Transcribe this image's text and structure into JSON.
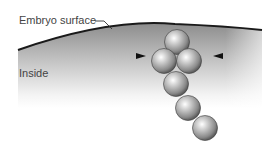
{
  "labels": {
    "surface": "Embryo surface",
    "inside": "Inside"
  },
  "colors": {
    "surface_line": "#1a1a1a",
    "shading_dark": "#8a8a8a",
    "sphere_mid": "#9a9a9a",
    "label_text": "#444444"
  },
  "spheres": [
    {
      "cx": 177,
      "cy": 42
    },
    {
      "cx": 164,
      "cy": 61
    },
    {
      "cx": 189,
      "cy": 61
    },
    {
      "cx": 176,
      "cy": 84
    },
    {
      "cx": 188,
      "cy": 108
    },
    {
      "cx": 205,
      "cy": 128
    }
  ],
  "arrowheads": [
    {
      "direction": "right",
      "x": 143,
      "y": 56
    },
    {
      "direction": "left",
      "x": 216,
      "y": 56
    }
  ]
}
